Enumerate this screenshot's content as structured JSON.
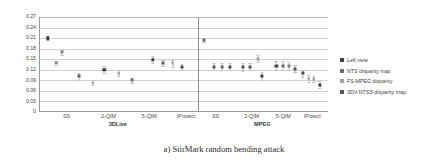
{
  "figure": {
    "caption": "a) StirMark random bending attack"
  },
  "legend": {
    "position": "right",
    "items": [
      {
        "label": "Left view",
        "color": "#3f3f3f"
      },
      {
        "label": "NTS disparity map",
        "color": "#6d6d6d"
      },
      {
        "label": "FS-MPEG disparity",
        "color": "#a0a0a0"
      },
      {
        "label": "3DV-NTSS disparity map",
        "color": "#555555"
      }
    ]
  },
  "chart_data": {
    "type": "scatter",
    "title": "",
    "xlabel": "",
    "ylabel": "",
    "ylim": [
      0,
      0.27
    ],
    "yticks": [
      "0.27",
      "0.24",
      "0.21",
      "0.18",
      "0.15",
      "0.12",
      "0.09",
      "0.06",
      "0.03",
      "0"
    ],
    "ytick_values": [
      0.27,
      0.24,
      0.21,
      0.18,
      0.15,
      0.12,
      0.09,
      0.06,
      0.03,
      0
    ],
    "grid": true,
    "panels": [
      "3DLive",
      "MPEG"
    ],
    "categories": [
      "SS",
      "2-QIM",
      "5-QIM",
      "IProtect",
      "SS",
      "2-QIM",
      "5-QIM",
      "IPotect"
    ],
    "category_panels": [
      "3DLive",
      "3DLive",
      "3DLive",
      "3DLive",
      "MPEG",
      "MPEG",
      "MPEG",
      "MPEG"
    ],
    "series": [
      {
        "name": "Left view",
        "color": "#3f3f3f",
        "values": [
          0.21,
          0.101,
          0.12,
          0.083,
          0.205,
          0.128,
          0.131,
          0.123
        ],
        "errors": [
          0.006,
          0.01,
          0.011,
          0.009,
          0.005,
          0.011,
          0.012,
          0.013
        ]
      },
      {
        "name": "NTS disparity map",
        "color": "#6d6d6d",
        "values": [
          0.17,
          0.083,
          0.139,
          0.09,
          0.129,
          0.129,
          0.102,
          0.126
        ],
        "errors": [
          0.007,
          0.008,
          0.01,
          0.007,
          0.01,
          0.01,
          0.009,
          0.013
        ]
      },
      {
        "name": "FS-MPEG disparity",
        "color": "#a0a0a0",
        "values": [
          0.14,
          0.11,
          0.138,
          0.09,
          0.128,
          0.152,
          0.126,
          0.081
        ]
      },
      {
        "name": "3DV-NTSS disparity map",
        "color": "#555555",
        "values": [
          0.12,
          0.09,
          0.128,
          0.075,
          0.126,
          0.125,
          0.125,
          0.072
        ],
        "errors": [
          0.008,
          0.007,
          0.01,
          0.006,
          0.01,
          0.01,
          0.011,
          0.011
        ]
      }
    ],
    "points": [
      {
        "panel": "3DLive",
        "group": "SS",
        "series": "Left view",
        "x": 0.03,
        "y": 0.21,
        "err": 0.006,
        "size": 3.4,
        "color": "#3f3f3f"
      },
      {
        "panel": "3DLive",
        "group": "SS",
        "series": "NTS disparity map",
        "x": 0.085,
        "y": 0.17,
        "err": 0.007,
        "size": 3.0,
        "color": "#8a8a8a"
      },
      {
        "panel": "3DLive",
        "group": "SS",
        "series": "FS-MPEG disparity",
        "x": 0.062,
        "y": 0.14,
        "err": 0.006,
        "size": 2.6,
        "color": "#7d7d7d"
      },
      {
        "panel": "3DLive",
        "group": "2-QIM",
        "series": "Left view",
        "x": 0.148,
        "y": 0.101,
        "err": 0.009,
        "size": 3.0,
        "color": "#5f5f5f"
      },
      {
        "panel": "3DLive",
        "group": "2-QIM",
        "series": "NTS disparity map",
        "x": 0.2,
        "y": 0.083,
        "err": 0.007,
        "size": 2.6,
        "color": "#9a9a9a"
      },
      {
        "panel": "3DLive",
        "group": "5-QIM",
        "series": "Left view",
        "x": 0.245,
        "y": 0.12,
        "err": 0.01,
        "size": 3.4,
        "color": "#3f3f3f"
      },
      {
        "panel": "3DLive",
        "group": "5-QIM",
        "series": "FS-MPEG disparity",
        "x": 0.3,
        "y": 0.11,
        "err": 0.008,
        "size": 2.6,
        "color": "#9a9a9a"
      },
      {
        "panel": "3DLive",
        "group": "5-QIM",
        "series": "3DV-NTSS disparity map",
        "x": 0.352,
        "y": 0.09,
        "err": 0.007,
        "size": 2.8,
        "color": "#707070"
      },
      {
        "panel": "3DLive",
        "group": "IProtect",
        "series": "Left view",
        "x": 0.43,
        "y": 0.149,
        "err": 0.009,
        "size": 3.4,
        "color": "#3f3f3f"
      },
      {
        "panel": "3DLive",
        "group": "IProtect",
        "series": "NTS disparity map",
        "x": 0.47,
        "y": 0.139,
        "err": 0.009,
        "size": 3.0,
        "color": "#5f5f5f"
      },
      {
        "panel": "3DLive",
        "group": "IProtect",
        "series": "FS-MPEG disparity",
        "x": 0.505,
        "y": 0.138,
        "err": 0.009,
        "size": 2.8,
        "color": "#a4a4a4"
      },
      {
        "panel": "3DLive",
        "group": "IProtect",
        "series": "3DV-NTSS disparity map",
        "x": 0.54,
        "y": 0.128,
        "err": 0.009,
        "size": 3.0,
        "color": "#4f4f4f"
      },
      {
        "panel": "MPEG",
        "group": "SS",
        "series": "Left view",
        "x": 0.625,
        "y": 0.205,
        "err": 0.005,
        "size": 3.2,
        "color": "#6a6a6a"
      },
      {
        "panel": "MPEG",
        "group": "SS",
        "series": "NTS disparity map",
        "x": 0.662,
        "y": 0.128,
        "err": 0.01,
        "size": 3.0,
        "color": "#5a5a5a"
      },
      {
        "panel": "MPEG",
        "group": "SS",
        "series": "FS-MPEG disparity",
        "x": 0.692,
        "y": 0.128,
        "err": 0.01,
        "size": 2.8,
        "color": "#6a6a6a"
      },
      {
        "panel": "MPEG",
        "group": "SS",
        "series": "3DV-NTSS disparity map",
        "x": 0.722,
        "y": 0.129,
        "err": 0.011,
        "size": 3.2,
        "color": "#4a4a4a"
      },
      {
        "panel": "MPEG",
        "group": "2-QIM",
        "series": "Left view",
        "x": 0.772,
        "y": 0.128,
        "err": 0.011,
        "size": 3.2,
        "color": "#4a4a4a"
      },
      {
        "panel": "MPEG",
        "group": "2-QIM",
        "series": "NTS disparity map",
        "x": 0.8,
        "y": 0.129,
        "err": 0.011,
        "size": 3.0,
        "color": "#5a5a5a"
      },
      {
        "panel": "MPEG",
        "group": "2-QIM",
        "series": "FS-MPEG disparity",
        "x": 0.828,
        "y": 0.152,
        "err": 0.01,
        "size": 3.0,
        "color": "#a0a0a0"
      },
      {
        "panel": "MPEG",
        "group": "2-QIM",
        "series": "3DV-NTSS disparity map",
        "x": 0.845,
        "y": 0.102,
        "err": 0.011,
        "size": 3.2,
        "color": "#3f3f3f"
      },
      {
        "panel": "MPEG",
        "group": "5-QIM",
        "series": "Left view",
        "x": 0.9,
        "y": 0.131,
        "err": 0.013,
        "size": 3.2,
        "color": "#4a4a4a"
      },
      {
        "panel": "MPEG",
        "group": "5-QIM",
        "series": "NTS disparity map",
        "x": 0.925,
        "y": 0.131,
        "err": 0.013,
        "size": 3.0,
        "color": "#6a6a6a"
      },
      {
        "panel": "MPEG",
        "group": "5-QIM",
        "series": "FS-MPEG disparity",
        "x": 0.948,
        "y": 0.13,
        "err": 0.012,
        "size": 3.0,
        "color": "#7a7a7a"
      },
      {
        "panel": "MPEG",
        "group": "5-QIM",
        "series": "3DV-NTSS disparity map",
        "x": 0.972,
        "y": 0.123,
        "err": 0.01,
        "size": 3.0,
        "color": "#555555"
      },
      {
        "panel": "MPEG",
        "group": "IPotect",
        "series": "Left view",
        "x": 1.0,
        "y": 0.11,
        "err": 0.01,
        "size": 3.2,
        "color": "#4a4a4a"
      },
      {
        "panel": "MPEG",
        "group": "IPotect",
        "series": "NTS disparity map",
        "x": 1.022,
        "y": 0.095,
        "err": 0.009,
        "size": 2.8,
        "color": "#8a8a8a"
      },
      {
        "panel": "MPEG",
        "group": "IPotect",
        "series": "FS-MPEG disparity",
        "x": 1.042,
        "y": 0.094,
        "err": 0.009,
        "size": 2.6,
        "color": "#9a9a9a"
      },
      {
        "panel": "MPEG",
        "group": "IPotect",
        "series": "3DV-NTSS disparity map",
        "x": 1.065,
        "y": 0.078,
        "err": 0.011,
        "size": 3.2,
        "color": "#3f3f3f"
      }
    ],
    "xtick_positions": [
      0.105,
      0.265,
      0.42,
      0.56,
      0.672,
      0.81,
      0.93,
      1.04
    ],
    "group_label_positions": [
      0.3,
      0.85
    ],
    "panel_divider_x": 0.6
  }
}
